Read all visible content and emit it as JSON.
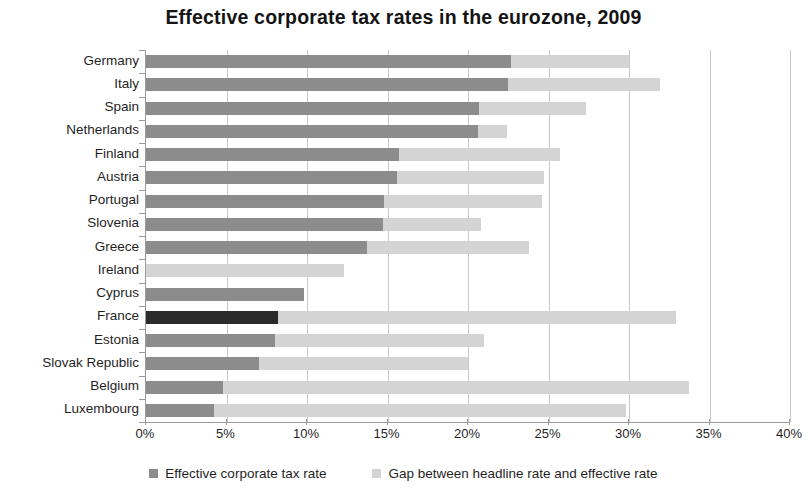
{
  "chart_data": {
    "type": "bar",
    "orientation": "horizontal",
    "stacked": true,
    "title": "Effective corporate tax rates in the eurozone, 2009",
    "xlabel": "",
    "ylabel": "",
    "xlim": [
      0,
      40
    ],
    "xticks": [
      0,
      5,
      10,
      15,
      20,
      25,
      30,
      35,
      40
    ],
    "xticklabels": [
      "0%",
      "5%",
      "10%",
      "15%",
      "20%",
      "25%",
      "30%",
      "35%",
      "40%"
    ],
    "grid": "vertical",
    "legend_position": "bottom",
    "categories": [
      "Germany",
      "Italy",
      "Spain",
      "Netherlands",
      "Finland",
      "Austria",
      "Portugal",
      "Slovenia",
      "Greece",
      "Ireland",
      "Cyprus",
      "France",
      "Estonia",
      "Slovak Republic",
      "Belgium",
      "Luxembourg"
    ],
    "series": [
      {
        "name": "Effective corporate tax rate",
        "color": "#8c8c8c",
        "values": [
          22.7,
          22.5,
          20.7,
          20.6,
          15.7,
          15.6,
          14.8,
          14.7,
          13.7,
          0.0,
          9.8,
          8.2,
          8.0,
          7.0,
          4.8,
          4.2
        ]
      },
      {
        "name": "Gap between headline rate and effective rate",
        "color": "#d4d4d4",
        "values": [
          7.3,
          9.4,
          6.6,
          1.8,
          10.0,
          9.1,
          9.8,
          6.1,
          10.1,
          12.3,
          0.0,
          24.7,
          13.0,
          13.0,
          28.9,
          25.6
        ]
      }
    ],
    "totals": [
      30.0,
      31.9,
      27.3,
      22.4,
      25.7,
      24.7,
      24.6,
      20.8,
      23.8,
      12.3,
      9.8,
      32.9,
      21.0,
      20.0,
      33.7,
      29.8
    ],
    "highlighted_category": "France",
    "highlight_color": "#2b2b2b"
  },
  "legend": {
    "items": [
      {
        "label": "Effective corporate tax rate",
        "swatch": "effective"
      },
      {
        "label": "Gap between headline rate and effective rate",
        "swatch": "gap"
      }
    ]
  }
}
